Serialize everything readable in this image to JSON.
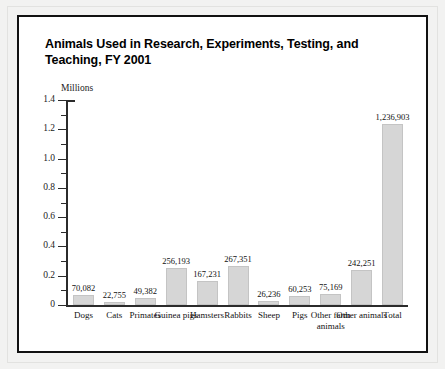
{
  "chart_data": {
    "type": "bar",
    "title": "Animals Used in Research, Experiments, Testing, and Teaching, FY 2001",
    "ylabel": "Millions",
    "xlabel": "",
    "ylim": [
      0,
      1.4
    ],
    "y_major_ticks": [
      "0",
      "0.2",
      "0.4",
      "0.6",
      "0.8",
      "1.0",
      "1.2",
      "1.4"
    ],
    "y_major_values": [
      0,
      0.2,
      0.4,
      0.6,
      0.8,
      1.0,
      1.2,
      1.4
    ],
    "y_minor_values": [
      0.1,
      0.3,
      0.5,
      0.7,
      0.9,
      1.1,
      1.3
    ],
    "grid": false,
    "legend": "none",
    "categories": [
      "Dogs",
      "Cats",
      "Primates",
      "Guinea pigs",
      "Hamsters",
      "Rabbits",
      "Sheep",
      "Pigs",
      "Other farm animals",
      "Other animals",
      "Total"
    ],
    "values": [
      70082,
      22755,
      49382,
      256193,
      167231,
      267351,
      26236,
      60253,
      75169,
      242251,
      1236903
    ],
    "value_labels": [
      "70,082",
      "22,755",
      "49,382",
      "256,193",
      "167,231",
      "267,351",
      "26,236",
      "60,253",
      "75,169",
      "242,251",
      "1,236,903"
    ],
    "bar_color": "#d6d6d6",
    "axis_color": "#2b2b2b"
  },
  "figure": {
    "frame_color": "#111111",
    "paper_color": "#f2f2f1",
    "plot_background": "#ffffff"
  }
}
